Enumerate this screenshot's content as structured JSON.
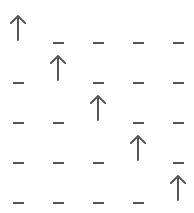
{
  "grid": {
    "rows": 5,
    "cols": 5,
    "cells": [
      [
        "up-arrow",
        "dash",
        "dash",
        "dash",
        "dash"
      ],
      [
        "dash",
        "up-arrow",
        "dash",
        "dash",
        "dash"
      ],
      [
        "dash",
        "dash",
        "up-arrow",
        "dash",
        "dash"
      ],
      [
        "dash",
        "dash",
        "dash",
        "up-arrow",
        "dash"
      ],
      [
        "dash",
        "dash",
        "dash",
        "dash",
        "up-arrow"
      ]
    ],
    "colors": {
      "stroke": "#555555",
      "background": "#ffffff"
    }
  }
}
